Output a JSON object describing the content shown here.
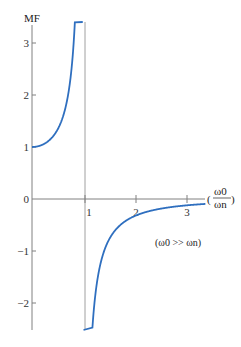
{
  "chart_data": {
    "type": "line",
    "title": "",
    "ylabel": "MF",
    "xlabel": "(ω0/ωn)",
    "xlabel_num": "ω0",
    "xlabel_den": "ωn",
    "xlim": [
      0,
      3.4
    ],
    "ylim": [
      -2.6,
      3.4
    ],
    "x_ticks": [
      1,
      2,
      3
    ],
    "x_tick_labels": [
      "1",
      "2",
      "3"
    ],
    "y_ticks": [
      -2,
      -1,
      0,
      1,
      2,
      3
    ],
    "y_tick_labels": [
      "−2",
      "−1",
      "0",
      "1",
      "2",
      "3"
    ],
    "grid": false,
    "vertical_line": {
      "x": 1
    },
    "annotation": "(ω0 >> ωn)",
    "series": [
      {
        "name": "MF upper branch (r < 1)",
        "formula": "1/(1 - r^2)",
        "x": [
          0,
          0.2,
          0.4,
          0.5,
          0.6,
          0.7,
          0.8,
          0.85,
          0.9,
          0.95
        ],
        "values": [
          1.0,
          1.04,
          1.19,
          1.33,
          1.56,
          1.96,
          2.78,
          3.6,
          5.26,
          10.3
        ]
      },
      {
        "name": "MF lower branch (r > 1)",
        "formula": "1/(1 - r^2)",
        "x": [
          1.05,
          1.1,
          1.2,
          1.4,
          1.6,
          2.0,
          2.5,
          3.0,
          3.4
        ],
        "values": [
          -9.76,
          -4.76,
          -2.27,
          -1.04,
          -0.64,
          -0.33,
          -0.19,
          -0.125,
          -0.095
        ]
      }
    ],
    "colors": {
      "curve": "#2f6fbf",
      "axis": "#7a7a7a",
      "vline": "#9a9a9a"
    }
  }
}
